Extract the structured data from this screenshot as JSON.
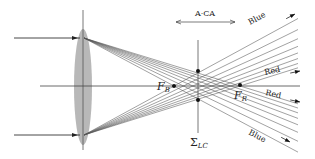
{
  "diagram": {
    "colors": {
      "line": "#333333",
      "ray": "#444444",
      "lens": "#b8b8b8",
      "text": "#222222",
      "background": "#ffffff"
    },
    "optical_axis": {
      "y": 86,
      "x1": 40,
      "x2": 300
    },
    "lens": {
      "cx": 83,
      "cy": 87,
      "rx": 9,
      "ry": 58,
      "axis_top": 10,
      "axis_bottom": 150
    },
    "incident_rays": [
      {
        "x1": 14,
        "y": 38,
        "x2": 80
      },
      {
        "x1": 14,
        "y": 135,
        "x2": 80
      }
    ],
    "focal_points": {
      "blue": {
        "x": 174,
        "y": 86,
        "label": "F",
        "subscript": "B"
      },
      "red": {
        "x": 240,
        "y": 85,
        "label": "F",
        "subscript": "R"
      }
    },
    "circle_least_confusion": {
      "x": 198,
      "y_top": 40,
      "y_bottom": 133,
      "dots": [
        {
          "y": 71
        },
        {
          "y": 100
        }
      ],
      "label": "Σ",
      "subscript": "LC"
    },
    "aca": {
      "label": "A·CA",
      "x1": 174,
      "x2": 237,
      "y": 22
    },
    "ray_labels": [
      {
        "text": "Blue",
        "x": 250,
        "y": 25,
        "rotate": -28,
        "arrow_to": [
          295,
          14
        ]
      },
      {
        "text": "Red",
        "x": 265,
        "y": 75,
        "rotate": -12,
        "arrow_to": [
          300,
          71
        ]
      },
      {
        "text": "Red",
        "x": 265,
        "y": 95,
        "rotate": 12,
        "arrow_to": [
          300,
          102
        ]
      },
      {
        "text": "Blue",
        "x": 248,
        "y": 134,
        "rotate": 28,
        "arrow_to": [
          290,
          142
        ]
      }
    ]
  }
}
